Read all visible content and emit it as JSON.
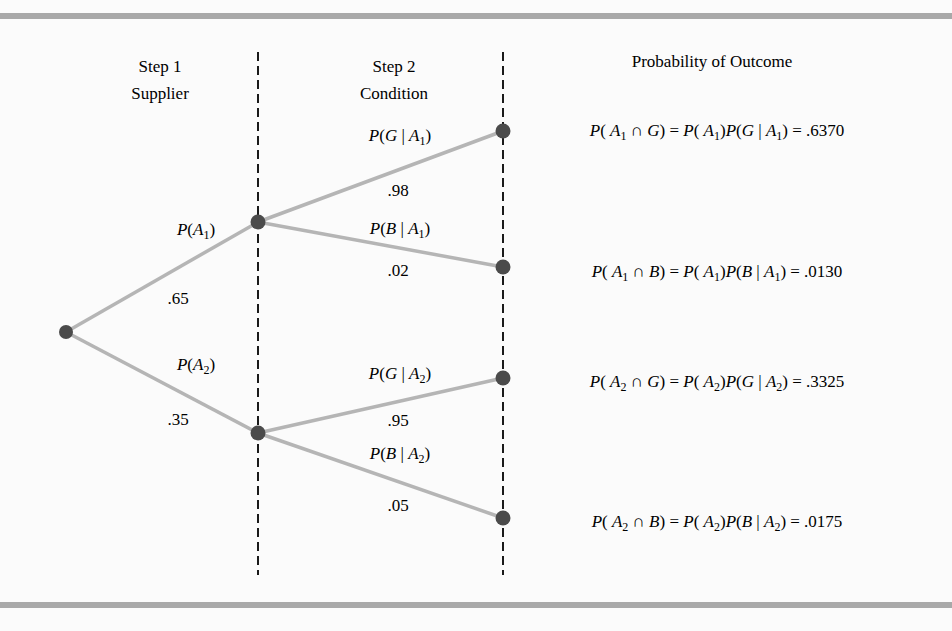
{
  "headers": {
    "step1_line1": "Step 1",
    "step1_line2": "Supplier",
    "step2_line1": "Step 2",
    "step2_line2": "Condition",
    "outcome": "Probability of Outcome"
  },
  "colors": {
    "edge": "#b5b5b5",
    "node": "#4b4b4b",
    "dash": "#1a1a1a",
    "rule": "#a9a9a9",
    "background": "#fbfbfb"
  },
  "tree": {
    "root": {
      "x": 66,
      "y": 332
    },
    "step1": [
      {
        "id": "A1",
        "label": "P(A1)",
        "event": "A",
        "index": "1",
        "prob": ".65",
        "x": 258,
        "y": 222
      },
      {
        "id": "A2",
        "label": "P(A2)",
        "event": "A",
        "index": "2",
        "prob": ".35",
        "x": 258,
        "y": 433
      }
    ],
    "step2": [
      {
        "parent": "A1",
        "label": "P(G | A1)",
        "cond": "G",
        "index": "1",
        "prob": ".98",
        "x": 503,
        "y": 131
      },
      {
        "parent": "A1",
        "label": "P(B | A1)",
        "cond": "B",
        "index": "1",
        "prob": ".02",
        "x": 503,
        "y": 267
      },
      {
        "parent": "A2",
        "label": "P(G | A2)",
        "cond": "G",
        "index": "2",
        "prob": ".95",
        "x": 503,
        "y": 378
      },
      {
        "parent": "A2",
        "label": "P(B | A2)",
        "cond": "B",
        "index": "2",
        "prob": ".05",
        "x": 503,
        "y": 518
      }
    ]
  },
  "outcomes": [
    {
      "formula": "P(A1 ∩ G) = P(A1)P(G | A1) = .6370",
      "event": "A",
      "index": "1",
      "cond": "G",
      "value": ".6370"
    },
    {
      "formula": "P(A1 ∩ B) = P(A1)P(B | A1) = .0130",
      "event": "A",
      "index": "1",
      "cond": "B",
      "value": ".0130"
    },
    {
      "formula": "P(A2 ∩ G) = P(A2)P(G | A2) = .3325",
      "event": "A",
      "index": "2",
      "cond": "G",
      "value": ".3325"
    },
    {
      "formula": "P(A2 ∩ B) = P(A2)P(B | A2) = .0175",
      "event": "A",
      "index": "2",
      "cond": "B",
      "value": ".0175"
    }
  ]
}
